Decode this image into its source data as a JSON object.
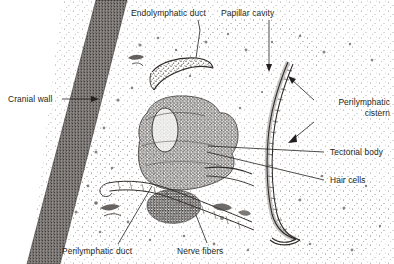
{
  "figure": {
    "width": 394,
    "height": 264,
    "background_color": "#ffffff",
    "ink_color": "#231f20",
    "stipple_color": "#55504e"
  },
  "labels": [
    {
      "id": "endolymphatic-duct",
      "text": "Endolymphatic duct",
      "x": 131,
      "y": 8,
      "leader": "line-down-right"
    },
    {
      "id": "papillar-cavity",
      "text": "Papillar cavity",
      "x": 248,
      "y": 8,
      "leader": "arrow-down"
    },
    {
      "id": "cranial-wall",
      "text": "Cranial wall",
      "x": 8,
      "y": 94,
      "leader": "arrow-right"
    },
    {
      "id": "perilymphatic-cistern",
      "text": "Perilymphatic cistern",
      "line1": "Perilymphatic",
      "line2": "cistern",
      "x": 318,
      "y": 97,
      "leader": "two-arrows-left"
    },
    {
      "id": "tectorial-body",
      "text": "Tectorial body",
      "x": 327,
      "y": 148,
      "leader": "line-left"
    },
    {
      "id": "hair-cells",
      "text": "Hair cells",
      "x": 327,
      "y": 176,
      "leader": "line-left"
    },
    {
      "id": "perilymphatic-duct",
      "text": "Perilymphatic duct",
      "x": 65,
      "y": 247,
      "leader": "line-up-right"
    },
    {
      "id": "nerve-fibers",
      "text": "Nerve fibers",
      "x": 180,
      "y": 247,
      "leader": "line-up"
    }
  ],
  "structures": [
    {
      "id": "cranial-wall-band",
      "description": "dark stippled diagonal band at left"
    },
    {
      "id": "endolymphatic-duct-crescent",
      "description": "curved crescent duct upper middle"
    },
    {
      "id": "tectorial-body-mass",
      "description": "dense domed stippled mass at center"
    },
    {
      "id": "perilymphatic-membrane",
      "description": "long sinuous cellular membrane at right"
    },
    {
      "id": "nerve-fiber-cluster",
      "description": "dark irregular cluster lower middle"
    },
    {
      "id": "perilymphatic-duct-channel",
      "description": "narrow channel lower left"
    },
    {
      "id": "papillar-cavity-space",
      "description": "open stippled cavity upper right"
    }
  ]
}
